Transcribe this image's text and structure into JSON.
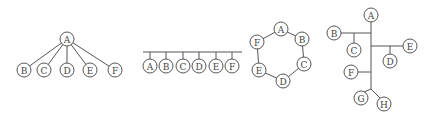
{
  "diagrams": [
    {
      "name": "star-topology",
      "nodes": [
        {
          "id": "A",
          "label": "A",
          "x": 67,
          "y": 39
        },
        {
          "id": "B",
          "label": "B",
          "x": 24,
          "y": 70
        },
        {
          "id": "C",
          "label": "C",
          "x": 44,
          "y": 70
        },
        {
          "id": "D",
          "label": "D",
          "x": 67,
          "y": 70
        },
        {
          "id": "E",
          "label": "E",
          "x": 90,
          "y": 70
        },
        {
          "id": "F",
          "label": "F",
          "x": 115,
          "y": 70
        }
      ],
      "edges": [
        [
          "A",
          "B"
        ],
        [
          "A",
          "C"
        ],
        [
          "A",
          "D"
        ],
        [
          "A",
          "E"
        ],
        [
          "A",
          "F"
        ]
      ]
    },
    {
      "name": "bus-topology",
      "bus": {
        "x1": 143,
        "x2": 242,
        "y": 52
      },
      "nodes": [
        {
          "id": "A",
          "label": "A",
          "x": 150,
          "y": 66
        },
        {
          "id": "B",
          "label": "B",
          "x": 166,
          "y": 66
        },
        {
          "id": "C",
          "label": "C",
          "x": 183,
          "y": 66
        },
        {
          "id": "D",
          "label": "D",
          "x": 199,
          "y": 66
        },
        {
          "id": "E",
          "label": "E",
          "x": 216,
          "y": 66
        },
        {
          "id": "F",
          "label": "F",
          "x": 232,
          "y": 66
        }
      ]
    },
    {
      "name": "ring-topology",
      "nodes": [
        {
          "id": "A",
          "label": "A",
          "x": 281,
          "y": 29
        },
        {
          "id": "B",
          "label": "B",
          "x": 302,
          "y": 39
        },
        {
          "id": "C",
          "label": "C",
          "x": 304,
          "y": 64
        },
        {
          "id": "D",
          "label": "D",
          "x": 283,
          "y": 81
        },
        {
          "id": "E",
          "label": "E",
          "x": 259,
          "y": 70
        },
        {
          "id": "F",
          "label": "F",
          "x": 257,
          "y": 42
        }
      ],
      "edges": [
        [
          "A",
          "B"
        ],
        [
          "B",
          "C"
        ],
        [
          "C",
          "D"
        ],
        [
          "D",
          "E"
        ],
        [
          "E",
          "F"
        ],
        [
          "F",
          "A"
        ]
      ]
    },
    {
      "name": "tree-topology",
      "nodes": [
        {
          "id": "A",
          "label": "A",
          "x": 371,
          "y": 15
        },
        {
          "id": "B",
          "label": "B",
          "x": 334,
          "y": 33
        },
        {
          "id": "C",
          "label": "C",
          "x": 354,
          "y": 50
        },
        {
          "id": "E",
          "label": "E",
          "x": 410,
          "y": 46
        },
        {
          "id": "D",
          "label": "D",
          "x": 390,
          "y": 61
        },
        {
          "id": "F",
          "label": "F",
          "x": 351,
          "y": 72
        },
        {
          "id": "G",
          "label": "G",
          "x": 361,
          "y": 98
        },
        {
          "id": "H",
          "label": "H",
          "x": 384,
          "y": 104
        }
      ],
      "lines": [
        [
          371,
          22,
          371,
          89
        ],
        [
          341,
          33,
          371,
          33
        ],
        [
          354,
          33,
          354,
          43
        ],
        [
          371,
          46,
          403,
          46
        ],
        [
          390,
          46,
          390,
          54
        ],
        [
          358,
          72,
          371,
          72
        ],
        [
          371,
          89,
          364,
          92
        ],
        [
          371,
          89,
          380,
          98
        ]
      ]
    }
  ]
}
